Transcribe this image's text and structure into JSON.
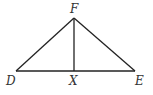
{
  "diagram": {
    "type": "geometry-triangle",
    "colors": {
      "line": "#222222",
      "label": "#333333",
      "background": "#ffffff"
    },
    "points": [
      {
        "id": "F",
        "label": "F",
        "x": 74,
        "y": 18
      },
      {
        "id": "D",
        "label": "D",
        "x": 16,
        "y": 71
      },
      {
        "id": "E",
        "label": "E",
        "x": 135,
        "y": 71
      },
      {
        "id": "X",
        "label": "X",
        "x": 74,
        "y": 71
      }
    ],
    "segments": [
      {
        "from": "D",
        "to": "F"
      },
      {
        "from": "F",
        "to": "E"
      },
      {
        "from": "D",
        "to": "E"
      },
      {
        "from": "F",
        "to": "X"
      }
    ],
    "labels": {
      "F": "F",
      "D": "D",
      "X": "X",
      "E": "E"
    }
  }
}
